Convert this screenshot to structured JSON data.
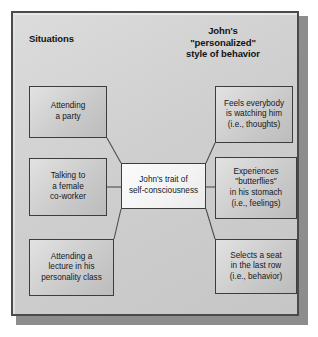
{
  "figure": {
    "headings": {
      "left": "Situations",
      "right": "John's\n\"personalized\"\nstyle of behavior",
      "right_line1": "John's",
      "right_line2": "\"personalized\"",
      "right_line3": "style of behavior"
    },
    "center_node": {
      "id": "trait",
      "text": "John's trait of\nself-consciousness",
      "line1": "John's trait of",
      "line2": "self-consciousness"
    },
    "situations": [
      {
        "id": "party",
        "text": "Attending\na party",
        "line1": "Attending",
        "line2": "a party"
      },
      {
        "id": "coworker",
        "text": "Talking to\na  female\nco-worker",
        "line1": "Talking to",
        "line2": "a  female",
        "line3": "co-worker"
      },
      {
        "id": "lecture",
        "text": "Attending a\nlecture in his\npersonality class",
        "line1": "Attending a",
        "line2": "lecture in his",
        "line3": "personality class"
      }
    ],
    "behaviors": [
      {
        "id": "thoughts",
        "text": "Feels everybody\nis watching him\n(i.e., thoughts)",
        "line1": "Feels everybody",
        "line2": "is watching him",
        "line3": "(i.e., thoughts)"
      },
      {
        "id": "feelings",
        "text": "Experiences\n\"butterflies\"\nin his stomach\n(i.e., feelings)",
        "line1": "Experiences",
        "line2": "\"butterflies\"",
        "line3": "in his stomach",
        "line4": "(i.e., feelings)"
      },
      {
        "id": "behavior",
        "text": "Selects a seat\nin the last row\n(i.e., behavior)",
        "line1": "Selects a seat",
        "line2": "in the last row",
        "line3": "(i.e., behavior)"
      }
    ],
    "colors": {
      "frame_background": "#cfcfcf",
      "frame_border": "#4a4a4a",
      "box_background": "#cbcbcb",
      "box_border": "#3d3d3d",
      "center_box_background": "#f3f3f3",
      "connector": "#4d4d4d",
      "text": "#17171a",
      "shadow": "#8d8d8d"
    }
  }
}
